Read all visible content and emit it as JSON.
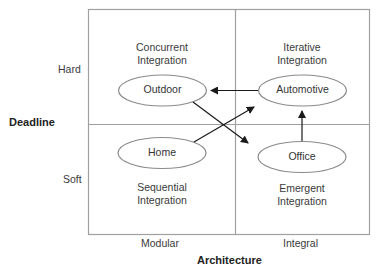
{
  "axes": {
    "y_title": "Deadline",
    "y_ticks": [
      "Hard",
      "Soft"
    ],
    "x_title": "Architecture",
    "x_ticks": [
      "Modular",
      "Integral"
    ]
  },
  "quadrants": [
    {
      "position": "top-left",
      "line1": "Concurrent",
      "line2": "Integration"
    },
    {
      "position": "top-right",
      "line1": "Iterative",
      "line2": "Integration"
    },
    {
      "position": "bottom-left",
      "line1": "Sequential",
      "line2": "Integration"
    },
    {
      "position": "bottom-right",
      "line1": "Emergent",
      "line2": "Integration"
    }
  ],
  "nodes": [
    {
      "id": "outdoor",
      "label": "Outdoor"
    },
    {
      "id": "automotive",
      "label": "Automotive"
    },
    {
      "id": "home",
      "label": "Home"
    },
    {
      "id": "office",
      "label": "Office"
    }
  ],
  "edges": [
    {
      "from": "Automotive",
      "to": "Outdoor"
    },
    {
      "from": "Outdoor",
      "to": "Office"
    },
    {
      "from": "Home",
      "to": "Automotive"
    },
    {
      "from": "Office",
      "to": "Automotive"
    }
  ],
  "colors": {
    "frame": "#9a9a9a",
    "ellipse": "#8a8a8a",
    "arrow": "#1a1a1a"
  }
}
